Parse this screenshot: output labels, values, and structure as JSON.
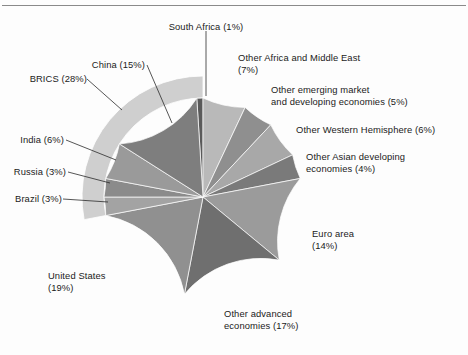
{
  "figure": {
    "background_color": "#fdfdfd",
    "rule_color": "#8a8a8a"
  },
  "chart_data": {
    "type": "pie",
    "title": "",
    "xlabel": "",
    "ylabel": "",
    "units": "percent of global GDP",
    "legend_position": "callout-labels",
    "grid": false,
    "start_angle_deg": 90,
    "direction": "clockwise",
    "categories": [
      "Other Africa and Middle East",
      "Other emerging market and developing economies",
      "Other Western Hemisphere",
      "Other Asian developing economies",
      "Euro area",
      "Other advanced economies",
      "United States",
      "Brazil",
      "Russia",
      "India",
      "China",
      "South Africa"
    ],
    "values": [
      7,
      5,
      6,
      4,
      14,
      17,
      19,
      3,
      3,
      6,
      15,
      1
    ],
    "colors": [
      "#b9b9b9",
      "#8f8f8f",
      "#a8a8a8",
      "#7a7a7a",
      "#9b9b9b",
      "#6f6f6f",
      "#909090",
      "#a3a3a3",
      "#8b8b8b",
      "#9a9a9a",
      "#7e7e7e",
      "#5a5a5a"
    ],
    "groups": [
      {
        "name": "BRICS",
        "value": 28,
        "members": [
          "China",
          "India",
          "Russia",
          "Brazil",
          "South Africa"
        ],
        "ring_color": "#cfcfcf"
      }
    ]
  },
  "labels": {
    "south_africa": "South Africa (1%)",
    "other_africa_middle_east": "Other Africa and Middle East\n(7%)",
    "other_emerging": "Other emerging market\nand developing economies (5%)",
    "other_western_hemisphere": "Other Western Hemisphere (6%)",
    "other_asian": "Other Asian developing\neconomies (4%)",
    "euro_area": "Euro area\n(14%)",
    "other_advanced": "Other advanced\neconomies (17%)",
    "united_states": "United States\n(19%)",
    "brazil": "Brazil (3%)",
    "russia": "Russia (3%)",
    "india": "India (6%)",
    "china": "China (15%)",
    "brics": "BRICS (28%)"
  }
}
